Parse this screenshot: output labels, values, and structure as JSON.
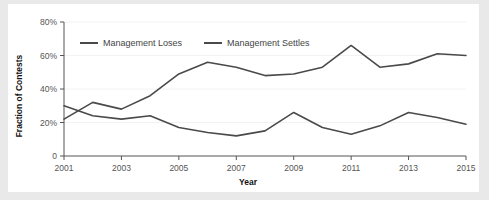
{
  "chart_data": {
    "type": "line",
    "title": "",
    "xlabel": "Year",
    "ylabel": "Fraction of Contests",
    "x": [
      2001,
      2002,
      2003,
      2004,
      2005,
      2006,
      2007,
      2008,
      2009,
      2010,
      2011,
      2012,
      2013,
      2014,
      2015
    ],
    "xlim": [
      2001,
      2015
    ],
    "ylim": [
      0,
      80
    ],
    "xticks": [
      2001,
      2003,
      2005,
      2007,
      2009,
      2011,
      2013,
      2015
    ],
    "xtick_labels": [
      "2001",
      "2003",
      "2005",
      "2007",
      "2009",
      "2011",
      "2013",
      "2015"
    ],
    "yticks": [
      0,
      20,
      40,
      60,
      80
    ],
    "ytick_labels": [
      "0",
      "20%",
      "40%",
      "60%",
      "80%"
    ],
    "grid": "faint-horizontal",
    "legend_position": "top-inside",
    "series": [
      {
        "name": "Management Loses",
        "color": "#4a4a4a",
        "values": [
          30,
          24,
          22,
          24,
          17,
          14,
          12,
          15,
          26,
          17,
          13,
          18,
          26,
          23,
          19
        ]
      },
      {
        "name": "Management Settles",
        "color": "#4a4a4a",
        "values": [
          22,
          32,
          28,
          36,
          49,
          56,
          53,
          48,
          49,
          53,
          66,
          53,
          55,
          61,
          60
        ]
      }
    ]
  },
  "figure": {
    "background": "#ffffff",
    "page_background": "#e9e9e9",
    "axis_color": "#555555",
    "line_color": "#4a4a4a"
  }
}
